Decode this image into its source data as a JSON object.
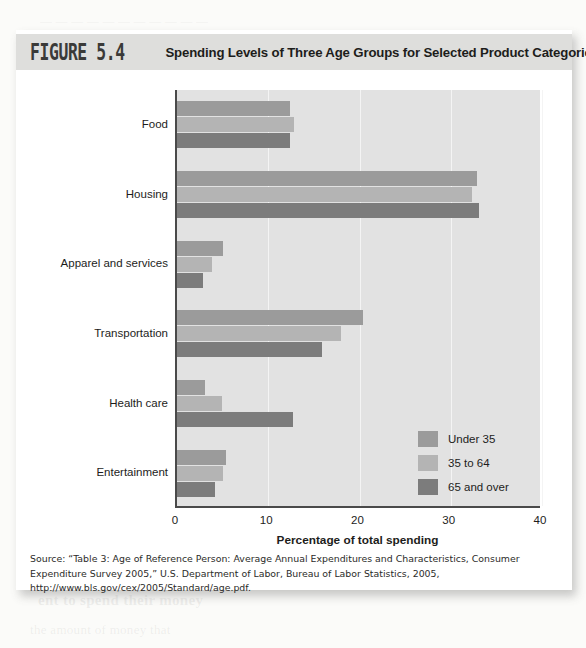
{
  "header": {
    "figure_number": "FIGURE 5.4",
    "title": "Spending Levels of Three Age Groups for Selected Product Categories"
  },
  "source": {
    "text": "Source: “Table 3: Age of Reference Person: Average Annual Expenditures and Characteristics, Consumer Expenditure Survey 2005,” U.S. Department of Labor, Bureau of Labor Statistics, 2005, http://www.bls.gov/cex/2005/Standard/age.pdf."
  },
  "bleed": {
    "top": "— — — — — — — — — — —",
    "line1": "ent to spend their money",
    "line2": "the amount of money that"
  },
  "colors": {
    "series_under35": "#9b9b9b",
    "series_35to64": "#b4b4b4",
    "series_65over": "#7c7c7c",
    "plot_background": "#e2e2e2",
    "axis": "#4a4a4a",
    "header_bar": "#dededc",
    "card": "#ffffff",
    "page": "#fbfbf9"
  },
  "chart_data": {
    "type": "bar",
    "orientation": "horizontal",
    "title": "Spending Levels of Three Age Groups for Selected Product Categories",
    "xlabel": "Percentage of total spending",
    "ylabel": "",
    "xlim": [
      0,
      40
    ],
    "xticks": [
      0,
      10,
      20,
      30,
      40
    ],
    "grid": true,
    "legend_position": "inside-right",
    "categories": [
      "Food",
      "Housing",
      "Apparel and services",
      "Transportation",
      "Health care",
      "Entertainment"
    ],
    "series": [
      {
        "name": "Under 35",
        "color": "#9b9b9b",
        "values": [
          12.4,
          32.9,
          5.0,
          20.4,
          3.1,
          5.4
        ]
      },
      {
        "name": "35 to 64",
        "color": "#b4b4b4",
        "values": [
          12.8,
          32.3,
          3.8,
          18.0,
          4.9,
          5.0
        ]
      },
      {
        "name": "65 and over",
        "color": "#7c7c7c",
        "values": [
          12.4,
          33.1,
          2.8,
          15.9,
          12.7,
          4.2
        ]
      }
    ]
  }
}
